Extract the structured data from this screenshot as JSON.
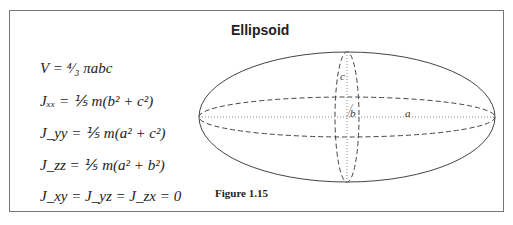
{
  "title": "Ellipsoid",
  "caption": "Figure 1.15",
  "equations": [
    "V = ⁴⁄₃ πabc",
    "Jₓₓ = ⅕ m(b² + c²)",
    "J_yy = ⅕ m(a² + c²)",
    "J_zz = ⅕ m(a² + b²)",
    "J_xy = J_yz = J_zx = 0"
  ],
  "axis_labels": {
    "a": "a",
    "b": "b",
    "c": "c"
  }
}
